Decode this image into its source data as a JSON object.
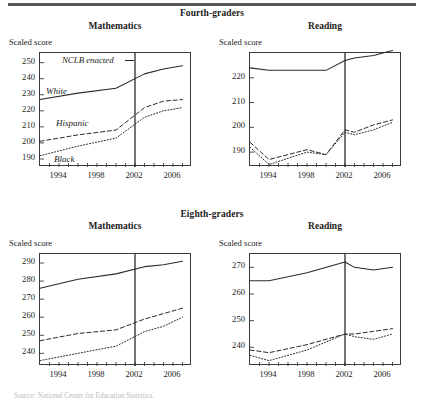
{
  "figure": {
    "panels": [
      {
        "id": "fourth",
        "label": "Fourth-graders"
      },
      {
        "id": "eighth",
        "label": "Eighth-graders"
      }
    ],
    "subjects": [
      "Mathematics",
      "Reading"
    ],
    "axis_caption": "Scaled score",
    "annotation": "NCLB enacted",
    "series_labels": {
      "white": "White",
      "hispanic": "Hispanic",
      "black": "Black"
    },
    "source_note": "Source: National Center for Education Statistics."
  },
  "chart_data": [
    {
      "id": "grade4-math",
      "type": "line",
      "title": "Mathematics",
      "panel": "Fourth-graders",
      "xlabel": "",
      "ylabel": "Scaled score",
      "xlim": [
        1992,
        2008
      ],
      "ylim": [
        185,
        256
      ],
      "yticks": [
        190,
        200,
        210,
        220,
        230,
        240,
        250
      ],
      "xticks": [
        1994,
        1998,
        2002,
        2006
      ],
      "grid": false,
      "legend": "inline-labels",
      "annotations": [
        {
          "text": "NCLB enacted",
          "x": 2002,
          "kind": "vline"
        }
      ],
      "x": [
        1992,
        1996,
        2000,
        2003,
        2005,
        2007
      ],
      "series": [
        {
          "name": "White",
          "style": "solid",
          "values": [
            227,
            231,
            234,
            243,
            246,
            248
          ]
        },
        {
          "name": "Hispanic",
          "style": "dashed",
          "values": [
            201,
            205,
            208,
            222,
            226,
            227
          ]
        },
        {
          "name": "Black",
          "style": "dotted",
          "values": [
            192,
            198,
            203,
            216,
            220,
            222
          ]
        }
      ]
    },
    {
      "id": "grade4-reading",
      "type": "line",
      "title": "Reading",
      "panel": "Fourth-graders",
      "xlabel": "",
      "ylabel": "Scaled score",
      "xlim": [
        1992,
        2008
      ],
      "ylim": [
        184,
        230
      ],
      "yticks": [
        190,
        200,
        210,
        220
      ],
      "xticks": [
        1994,
        1998,
        2002,
        2006
      ],
      "grid": false,
      "legend": "none",
      "annotations": [
        {
          "text": "NCLB enacted",
          "x": 2002,
          "kind": "vline"
        }
      ],
      "x": [
        1992,
        1994,
        1998,
        2000,
        2002,
        2003,
        2005,
        2007
      ],
      "series": [
        {
          "name": "White",
          "style": "solid",
          "values": [
            224,
            223,
            223,
            223,
            227,
            228,
            229,
            231
          ]
        },
        {
          "name": "Hispanic",
          "style": "dashed",
          "values": [
            194,
            187,
            191,
            189,
            199,
            198,
            201,
            203
          ]
        },
        {
          "name": "Black",
          "style": "dotted",
          "values": [
            192,
            185,
            190,
            189,
            198,
            197,
            199,
            202
          ]
        }
      ]
    },
    {
      "id": "grade8-math",
      "type": "line",
      "title": "Mathematics",
      "panel": "Eighth-graders",
      "xlabel": "",
      "ylabel": "Scaled score",
      "xlim": [
        1992,
        2008
      ],
      "ylim": [
        233,
        295
      ],
      "yticks": [
        240,
        250,
        260,
        270,
        280,
        290
      ],
      "xticks": [
        1994,
        1998,
        2002,
        2006
      ],
      "grid": false,
      "legend": "none",
      "annotations": [
        {
          "text": "NCLB enacted",
          "x": 2002,
          "kind": "vline"
        }
      ],
      "x": [
        1992,
        1996,
        2000,
        2003,
        2005,
        2007
      ],
      "series": [
        {
          "name": "White",
          "style": "solid",
          "values": [
            276,
            281,
            284,
            288,
            289,
            291
          ]
        },
        {
          "name": "Hispanic",
          "style": "dashed",
          "values": [
            247,
            251,
            253,
            259,
            262,
            265
          ]
        },
        {
          "name": "Black",
          "style": "dotted",
          "values": [
            236,
            240,
            244,
            252,
            255,
            260
          ]
        }
      ]
    },
    {
      "id": "grade8-reading",
      "type": "line",
      "title": "Reading",
      "panel": "Eighth-graders",
      "xlabel": "",
      "ylabel": "Scaled score",
      "xlim": [
        1992,
        2008
      ],
      "ylim": [
        233,
        275
      ],
      "yticks": [
        240,
        250,
        260,
        270
      ],
      "xticks": [
        1994,
        1998,
        2002,
        2006
      ],
      "grid": false,
      "legend": "none",
      "annotations": [
        {
          "text": "NCLB enacted",
          "x": 2002,
          "kind": "vline"
        }
      ],
      "x": [
        1992,
        1994,
        1998,
        2002,
        2003,
        2005,
        2007
      ],
      "series": [
        {
          "name": "White",
          "style": "solid",
          "values": [
            265,
            265,
            268,
            272,
            270,
            269,
            270
          ]
        },
        {
          "name": "Hispanic",
          "style": "dashed",
          "values": [
            239,
            238,
            241,
            245,
            245,
            246,
            247
          ]
        },
        {
          "name": "Black",
          "style": "dotted",
          "values": [
            237,
            235,
            239,
            245,
            244,
            243,
            245
          ]
        }
      ]
    }
  ],
  "geometry": {
    "charts": [
      {
        "id": "grade4-math",
        "left": 39,
        "top": 52,
        "width": 152,
        "height": 114
      },
      {
        "id": "grade4-reading",
        "left": 249,
        "top": 52,
        "width": 152,
        "height": 114
      },
      {
        "id": "grade8-math",
        "left": 39,
        "top": 253,
        "width": 152,
        "height": 112
      },
      {
        "id": "grade8-reading",
        "left": 249,
        "top": 253,
        "width": 152,
        "height": 112
      }
    ]
  }
}
